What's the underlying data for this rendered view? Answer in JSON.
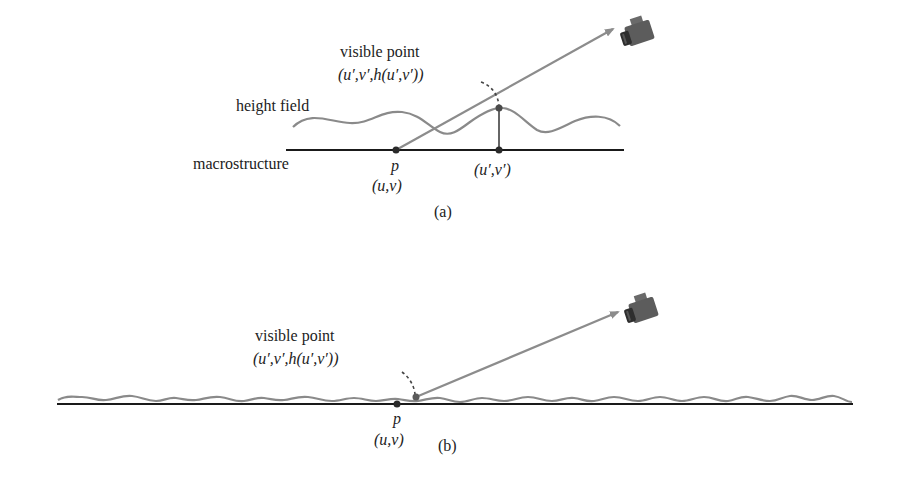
{
  "colors": {
    "macrostructure_line": "#1a1a1a",
    "height_field": "#8a8a8a",
    "ray": "#8c8c8c",
    "dot": "#2a2a2a",
    "dash": "#444444",
    "camera_body": "#5a5a5a",
    "camera_dark": "#333333"
  },
  "panel_a": {
    "caption": "(a)",
    "label_height_field": "height field",
    "label_macrostructure": "macrostructure",
    "label_visible_point": "visible point",
    "visible_point_coord": "(u′,v′,h(u′,v′))",
    "point_p": "p",
    "point_p_coord": "(u,v)",
    "point_uv_prime": "(u′,v′)"
  },
  "panel_b": {
    "caption": "(b)",
    "label_visible_point": "visible point",
    "visible_point_coord": "(u′,v′,h(u′,v′))",
    "point_p": "p",
    "point_p_coord": "(u,v)"
  }
}
